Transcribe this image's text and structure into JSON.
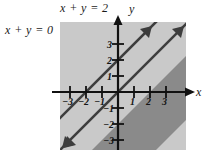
{
  "figure": {
    "type": "math-graph",
    "background_color": "#ffffff",
    "plot_background_color": "#c9c9c9",
    "band_color": "#8a8a8a",
    "line_color": "#3d3d3d",
    "axis_color": "#111111",
    "text_color": "#1a1a1a"
  },
  "labels": {
    "line_upper": "x + y = 2",
    "line_lower": "x + y = 0",
    "axis_y": "y",
    "axis_x": "x"
  },
  "chart_data": {
    "type": "line",
    "title": "",
    "xlabel": "x",
    "ylabel": "y",
    "xlim": [
      -3.6,
      4.2
    ],
    "ylim": [
      -3.8,
      4.0
    ],
    "grid": false,
    "legend": "none",
    "xticks": [
      -3,
      -2,
      -1,
      1,
      2,
      3
    ],
    "yticks": [
      -3,
      -2,
      -1,
      1,
      2,
      3
    ],
    "xtick_labels": [
      "-3",
      "-2",
      "-1",
      "1",
      "2",
      "3"
    ],
    "ytick_labels": [
      "-3",
      "-2",
      "-1",
      "1",
      "2",
      "3"
    ],
    "series": [
      {
        "name": "x + y = 0",
        "equation": "x + y = 0",
        "slope": -1,
        "intercept": 0,
        "style": "solid",
        "arrows": "both",
        "label": "x + y = 0"
      },
      {
        "name": "x + y = 2",
        "equation": "x + y = 2",
        "slope": -1,
        "intercept": 2,
        "style": "solid",
        "arrows": "both",
        "label": "x + y = 2"
      }
    ],
    "shaded_region": {
      "description": "Band between the lines x + y = 0 and x + y = 2",
      "inequality": "0 ≤ x + y ≤ 2",
      "fill": "#8a8a8a"
    },
    "annotations": [
      {
        "text": "x + y = 2",
        "position": "above-plot-left-of-y-axis"
      },
      {
        "text": "x + y = 0",
        "position": "left-of-plot"
      }
    ]
  },
  "xtick_positions": [
    {
      "label": "-3",
      "left": 62,
      "top": 97
    },
    {
      "label": "-2",
      "left": 78,
      "top": 97
    },
    {
      "label": "-1",
      "left": 94,
      "top": 97
    },
    {
      "label": "1",
      "left": 130,
      "top": 97
    },
    {
      "label": "2",
      "left": 146,
      "top": 97
    },
    {
      "label": "3",
      "left": 162,
      "top": 97
    }
  ],
  "ytick_positions": [
    {
      "label": "3",
      "left": 107,
      "top": 40
    },
    {
      "label": "2",
      "left": 107,
      "top": 56
    },
    {
      "label": "1",
      "left": 107,
      "top": 72
    },
    {
      "label": "-1",
      "left": 103,
      "top": 104
    },
    {
      "label": "-2",
      "left": 103,
      "top": 120
    },
    {
      "label": "-3",
      "left": 103,
      "top": 136
    }
  ]
}
